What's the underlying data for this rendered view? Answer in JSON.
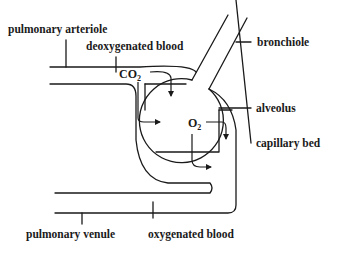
{
  "diagram": {
    "type": "biology-schematic",
    "labels": {
      "pulmonary_arteriole": "pulmonary arteriole",
      "deoxygenated_blood": "deoxygenated blood",
      "bronchiole": "bronchiole",
      "alveolus": "alveolus",
      "capillary_bed": "capillary bed",
      "pulmonary_venule": "pulmonary venule",
      "oxygenated_blood": "oxygenated blood"
    },
    "gases": {
      "co2": {
        "base": "CO",
        "subscript": "2"
      },
      "o2": {
        "base": "O",
        "subscript": "2"
      }
    },
    "colors": {
      "line": "#1a1a1a",
      "background": "#ffffff"
    }
  }
}
